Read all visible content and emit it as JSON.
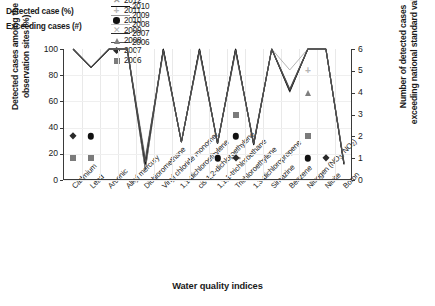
{
  "legend": {
    "row1_title": "Detected case (%)",
    "row2_title": "Exceeding cases (#)",
    "line_series": [
      {
        "year": "2013",
        "color": "#6e6e6e"
      },
      {
        "year": "2012",
        "color": "#4a4a4a"
      },
      {
        "year": "2011",
        "color": "#a8a8a8"
      },
      {
        "year": "2010",
        "color": "#111111"
      },
      {
        "year": "2009",
        "color": "#9a9a9a"
      },
      {
        "year": "2008",
        "color": "#bdbdbd"
      },
      {
        "year": "2007",
        "color": "#2b2b2b"
      },
      {
        "year": "2006",
        "color": "#555555"
      }
    ],
    "marker_series": [
      {
        "year": "2013",
        "shape": "dash",
        "color": "#8a8a8a",
        "glyph": "–"
      },
      {
        "year": "2012",
        "shape": "x",
        "color": "#9a9a9a",
        "glyph": "✕"
      },
      {
        "year": "2011",
        "shape": "plus",
        "color": "#b5b5b5",
        "glyph": "+"
      },
      {
        "year": "2010",
        "shape": "circle",
        "color": "#111111",
        "glyph": "●"
      },
      {
        "year": "2009",
        "shape": "cross",
        "color": "#b0b0b0",
        "glyph": "✕"
      },
      {
        "year": "2008",
        "shape": "triangle",
        "color": "#7f7f7f",
        "glyph": "▲"
      },
      {
        "year": "2007",
        "shape": "diamond",
        "color": "#2a2a2a",
        "glyph": "◆"
      },
      {
        "year": "2006",
        "shape": "square",
        "color": "#7b7b7b",
        "glyph": "■"
      }
    ]
  },
  "axes": {
    "left_title": "Detected cases amoing the observation sites (%)",
    "right_title": "Number of detected cases exceeding national standard value",
    "x_title": "Water quality indices",
    "left_ticks": [
      "100",
      "80",
      "60",
      "40",
      "20",
      "0"
    ],
    "right_ticks": [
      "6",
      "5",
      "4",
      "3",
      "2",
      "1",
      "0"
    ]
  },
  "chart_data": {
    "type": "line",
    "title": "",
    "xlabel": "Water quality indices",
    "ylabel": "Detected cases amoing the observation sites (%)",
    "y2label": "Number of detected cases exceeding national standard value",
    "ylim": [
      0,
      100
    ],
    "y2lim": [
      0,
      6
    ],
    "grid": true,
    "legend_position": "top",
    "categories": [
      "Cadmium",
      "Lead",
      "Arsenic",
      "Alkyl mercury",
      "Dichloromethane",
      "Vinyl chloride monomer",
      "1,1-dichloroethylene",
      "cis-1,2-dichloroethylene",
      "1,1,1-trichloroethane",
      "Trichloroethylene",
      "1,3-dichloropropene",
      "Simazine",
      "Benzene",
      "Nitrogen (NO3, NO2)",
      "Nitrite",
      "Boron"
    ],
    "series": [
      {
        "name": "2013",
        "color": "#6e6e6e",
        "values": [
          100,
          86,
          100,
          100,
          8,
          100,
          29,
          100,
          28,
          100,
          27,
          100,
          68,
          100,
          100,
          12
        ]
      },
      {
        "name": "2012",
        "color": "#4a4a4a",
        "values": [
          100,
          86,
          100,
          100,
          8,
          100,
          29,
          100,
          28,
          100,
          27,
          100,
          67,
          100,
          100,
          12
        ]
      },
      {
        "name": "2011",
        "color": "#a8a8a8",
        "values": [
          100,
          86,
          100,
          100,
          10,
          98,
          29,
          98,
          28,
          99,
          27,
          100,
          84,
          100,
          100,
          12
        ]
      },
      {
        "name": "2010",
        "color": "#111111",
        "values": [
          100,
          86,
          100,
          100,
          12,
          100,
          29,
          100,
          28,
          100,
          27,
          100,
          68,
          100,
          100,
          12
        ]
      },
      {
        "name": "2009",
        "color": "#9a9a9a",
        "values": [
          100,
          86,
          100,
          100,
          16,
          98,
          29,
          98,
          28,
          98,
          28,
          100,
          69,
          100,
          100,
          14
        ]
      },
      {
        "name": "2008",
        "color": "#bdbdbd",
        "values": [
          100,
          86,
          100,
          100,
          18,
          97,
          30,
          97,
          29,
          97,
          29,
          100,
          70,
          100,
          100,
          14
        ]
      },
      {
        "name": "2007",
        "color": "#2b2b2b",
        "values": [
          100,
          86,
          100,
          100,
          14,
          99,
          29,
          99,
          28,
          99,
          28,
          100,
          69,
          100,
          100,
          13
        ]
      },
      {
        "name": "2006",
        "color": "#555555",
        "values": [
          100,
          86,
          100,
          100,
          14,
          99,
          29,
          99,
          28,
          99,
          28,
          100,
          69,
          100,
          100,
          13
        ]
      }
    ],
    "exceeding_points": [
      {
        "series": "2007",
        "shape": "diamond",
        "color": "#2a2a2a",
        "category": "Cadmium",
        "value": 2.0
      },
      {
        "series": "2006",
        "shape": "square",
        "color": "#7b7b7b",
        "category": "Cadmium",
        "value": 1.0
      },
      {
        "series": "2010",
        "shape": "circle",
        "color": "#111111",
        "category": "Lead",
        "value": 2.0
      },
      {
        "series": "2006",
        "shape": "square",
        "color": "#7b7b7b",
        "category": "Lead",
        "value": 1.0
      },
      {
        "series": "2010",
        "shape": "circle",
        "color": "#111111",
        "category": "1,1,1-trichloroethane",
        "value": 1.0
      },
      {
        "series": "2013",
        "shape": "dash",
        "color": "#8a8a8a",
        "category": "Trichloroethylene",
        "value": 1.0
      },
      {
        "series": "2007",
        "shape": "diamond",
        "color": "#2a2a2a",
        "category": "Trichloroethylene",
        "value": 1.0
      },
      {
        "series": "2010",
        "shape": "circle",
        "color": "#111111",
        "category": "Trichloroethylene",
        "value": 2.0
      },
      {
        "series": "2006",
        "shape": "square",
        "color": "#7b7b7b",
        "category": "Trichloroethylene",
        "value": 3.0
      },
      {
        "series": "2011",
        "shape": "plus",
        "color": "#b5b5b5",
        "category": "Nitrogen (NO3, NO2)",
        "value": 5.0
      },
      {
        "series": "2008",
        "shape": "triangle",
        "color": "#7f7f7f",
        "category": "Nitrogen (NO3, NO2)",
        "value": 4.0
      },
      {
        "series": "2006",
        "shape": "square",
        "color": "#7b7b7b",
        "category": "Nitrogen (NO3, NO2)",
        "value": 2.0
      },
      {
        "series": "2010",
        "shape": "circle",
        "color": "#111111",
        "category": "Nitrogen (NO3, NO2)",
        "value": 1.0
      },
      {
        "series": "2007",
        "shape": "diamond",
        "color": "#2a2a2a",
        "category": "Nitrite",
        "value": 1.0
      }
    ]
  }
}
